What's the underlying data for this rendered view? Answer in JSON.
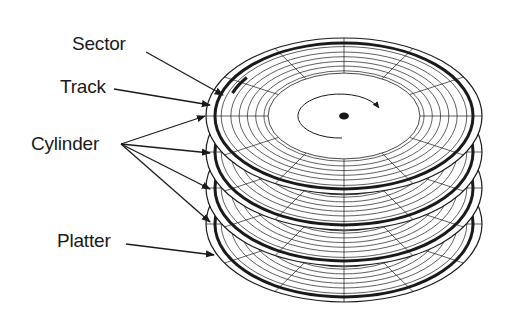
{
  "diagram": {
    "labels": {
      "sector": "Sector",
      "track": "Track",
      "cylinder": "Cylinder",
      "platter": "Platter"
    },
    "platter_count": 4,
    "colors": {
      "line": "#1a1a1a",
      "background": "#ffffff"
    }
  }
}
